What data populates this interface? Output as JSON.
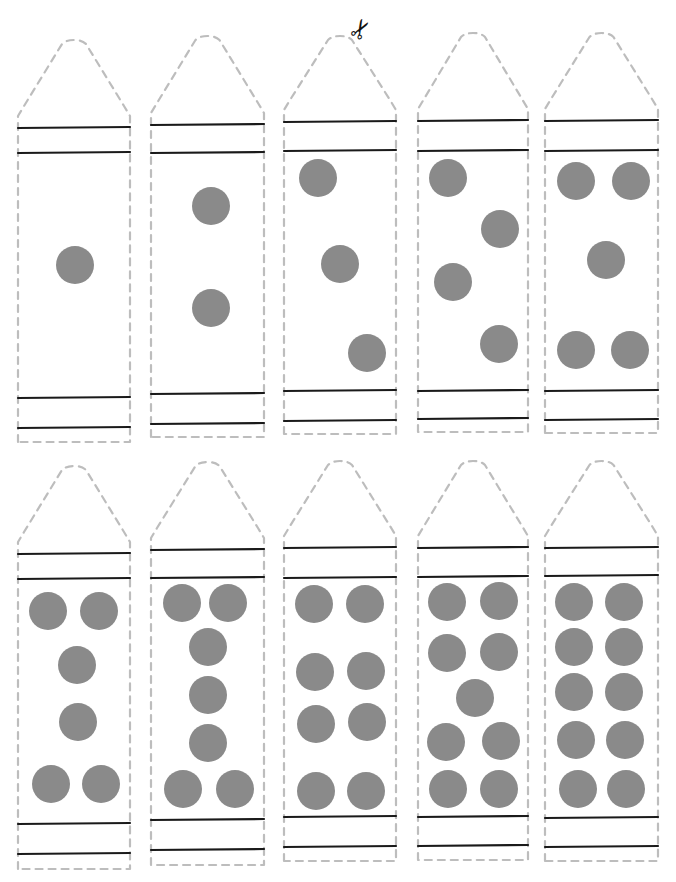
{
  "worksheet": {
    "title": "Crayon counting cut-outs",
    "top_text": "",
    "colors": {
      "outline": "#bdbdbd",
      "band": "#1a1a1a",
      "dot": "#8a8a8a",
      "background": "#ffffff"
    },
    "scissors": {
      "icon": "scissors-icon",
      "glyph": "✂",
      "x": 350,
      "y": 16
    },
    "crayons": [
      {
        "count": 1,
        "x": 18,
        "w": 112,
        "tipTop": 40,
        "band1": 128,
        "band2": 153,
        "band3": 398,
        "band4": 428,
        "bottom": 442,
        "dots": [
          [
            75,
            265
          ]
        ]
      },
      {
        "count": 2,
        "x": 151,
        "w": 113,
        "tipTop": 36,
        "band1": 125,
        "band2": 153,
        "band3": 394,
        "band4": 424,
        "bottom": 437,
        "dots": [
          [
            211,
            206
          ],
          [
            211,
            308
          ]
        ]
      },
      {
        "count": 3,
        "x": 284,
        "w": 112,
        "tipTop": 36,
        "band1": 122,
        "band2": 151,
        "band3": 391,
        "band4": 421,
        "bottom": 434,
        "dots": [
          [
            318,
            178
          ],
          [
            340,
            264
          ],
          [
            367,
            353
          ]
        ]
      },
      {
        "count": 4,
        "x": 418,
        "w": 110,
        "tipTop": 33,
        "band1": 121,
        "band2": 151,
        "band3": 391,
        "band4": 419,
        "bottom": 432,
        "dots": [
          [
            448,
            178
          ],
          [
            500,
            229
          ],
          [
            453,
            282
          ],
          [
            499,
            344
          ]
        ]
      },
      {
        "count": 5,
        "x": 545,
        "w": 113,
        "tipTop": 33,
        "band1": 121,
        "band2": 151,
        "band3": 391,
        "band4": 420,
        "bottom": 433,
        "dots": [
          [
            576,
            181
          ],
          [
            631,
            181
          ],
          [
            606,
            260
          ],
          [
            576,
            350
          ],
          [
            630,
            350
          ]
        ]
      },
      {
        "count": 6,
        "x": 18,
        "w": 112,
        "tipTop": 466,
        "band1": 554,
        "band2": 579,
        "band3": 824,
        "band4": 854,
        "bottom": 869,
        "dots": [
          [
            48,
            611
          ],
          [
            99,
            611
          ],
          [
            77,
            665
          ],
          [
            78,
            722
          ],
          [
            51,
            784
          ],
          [
            101,
            784
          ]
        ]
      },
      {
        "count": 7,
        "x": 151,
        "w": 113,
        "tipTop": 462,
        "band1": 550,
        "band2": 578,
        "band3": 820,
        "band4": 850,
        "bottom": 865,
        "dots": [
          [
            182,
            603
          ],
          [
            228,
            603
          ],
          [
            208,
            647
          ],
          [
            208,
            695
          ],
          [
            208,
            743
          ],
          [
            183,
            789
          ],
          [
            235,
            789
          ]
        ]
      },
      {
        "count": 8,
        "x": 284,
        "w": 112,
        "tipTop": 461,
        "band1": 548,
        "band2": 578,
        "band3": 817,
        "band4": 847,
        "bottom": 861,
        "dots": [
          [
            314,
            604
          ],
          [
            365,
            604
          ],
          [
            315,
            672
          ],
          [
            366,
            671
          ],
          [
            316,
            724
          ],
          [
            367,
            722
          ],
          [
            316,
            791
          ],
          [
            366,
            791
          ]
        ]
      },
      {
        "count": 9,
        "x": 418,
        "w": 110,
        "tipTop": 461,
        "band1": 548,
        "band2": 577,
        "band3": 817,
        "band4": 846,
        "bottom": 860,
        "dots": [
          [
            447,
            602
          ],
          [
            499,
            601
          ],
          [
            447,
            653
          ],
          [
            499,
            652
          ],
          [
            475,
            698
          ],
          [
            446,
            742
          ],
          [
            501,
            741
          ],
          [
            448,
            789
          ],
          [
            499,
            789
          ]
        ]
      },
      {
        "count": 10,
        "x": 545,
        "w": 113,
        "tipTop": 461,
        "band1": 548,
        "band2": 576,
        "band3": 818,
        "band4": 847,
        "bottom": 861,
        "dots": [
          [
            574,
            602
          ],
          [
            624,
            602
          ],
          [
            574,
            647
          ],
          [
            624,
            647
          ],
          [
            574,
            692
          ],
          [
            624,
            692
          ],
          [
            576,
            740
          ],
          [
            625,
            740
          ],
          [
            578,
            789
          ],
          [
            626,
            789
          ]
        ]
      }
    ]
  }
}
